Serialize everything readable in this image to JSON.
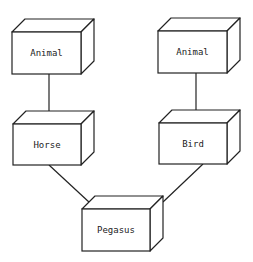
{
  "diagram": {
    "type": "uml-deployment-nodes",
    "colors": {
      "stroke": "#222222",
      "fill": "#ffffff",
      "background": "#ffffff"
    },
    "nodes": [
      {
        "id": "animal-left",
        "label": "Animal",
        "x": 12,
        "y": 32,
        "w": 69,
        "h": 42
      },
      {
        "id": "animal-right",
        "label": "Animal",
        "x": 158,
        "y": 31,
        "w": 69,
        "h": 42
      },
      {
        "id": "horse",
        "label": "Horse",
        "x": 13,
        "y": 124,
        "w": 68,
        "h": 41
      },
      {
        "id": "bird",
        "label": "Bird",
        "x": 159,
        "y": 123,
        "w": 68,
        "h": 41
      },
      {
        "id": "pegasus",
        "label": "Pegasus",
        "x": 82,
        "y": 209,
        "w": 68,
        "h": 42
      }
    ],
    "edges": [
      {
        "from": "animal-left",
        "to": "horse"
      },
      {
        "from": "animal-right",
        "to": "bird"
      },
      {
        "from": "horse",
        "to": "pegasus"
      },
      {
        "from": "bird",
        "to": "pegasus"
      }
    ]
  }
}
